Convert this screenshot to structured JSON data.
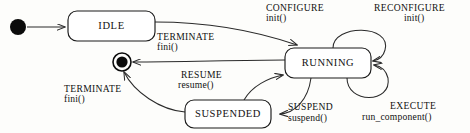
{
  "diagram": {
    "type": "uml-state-machine",
    "colors": {
      "background": "#fdfdfb",
      "stroke": "#1a1a1a",
      "node_fill": "#0b0b0b",
      "box_fill": "#ffffff",
      "text": "#111111"
    },
    "pseudostates": [
      {
        "id": "initial",
        "kind": "initial-state",
        "cx": 18,
        "cy": 27,
        "r": 8
      },
      {
        "id": "final",
        "kind": "final-state",
        "cx": 122,
        "cy": 62,
        "r_outer": 9,
        "r_inner": 5.6
      }
    ],
    "states": [
      {
        "id": "idle",
        "label": "IDLE",
        "x": 68,
        "y": 11,
        "w": 87,
        "h": 30
      },
      {
        "id": "running",
        "label": "RUNNING",
        "x": 285,
        "y": 48,
        "w": 86,
        "h": 30
      },
      {
        "id": "suspended",
        "label": "SUSPENDED",
        "x": 185,
        "y": 100,
        "w": 86,
        "h": 28
      }
    ],
    "transitions": [
      {
        "id": "start-to-idle",
        "from": "initial",
        "to": "idle",
        "event": "",
        "action": ""
      },
      {
        "id": "idle-to-running",
        "from": "idle",
        "to": "running",
        "event": "CONFIGURE",
        "action": "init()",
        "label_x": 266,
        "label_y": 11
      },
      {
        "id": "running-to-final",
        "from": "running",
        "to": "final",
        "event": "TERMINATE",
        "action": "fini()",
        "label_x": 157,
        "label_y": 40
      },
      {
        "id": "running-self-reconfigure",
        "from": "running",
        "to": "running",
        "event": "RECONFIGURE",
        "action": "init()",
        "label_x": 374,
        "label_y": 11
      },
      {
        "id": "running-self-execute",
        "from": "running",
        "to": "running",
        "event": "EXECUTE",
        "action": "run_component()",
        "label_x": 390,
        "label_y": 109
      },
      {
        "id": "running-to-suspended",
        "from": "running",
        "to": "suspended",
        "event": "SUSPEND",
        "action": "suspend()",
        "label_x": 288,
        "label_y": 110
      },
      {
        "id": "suspended-to-running",
        "from": "suspended",
        "to": "running",
        "event": "RESUME",
        "action": "resume()",
        "label_x": 181,
        "label_y": 78
      },
      {
        "id": "suspended-to-final",
        "from": "suspended",
        "to": "final",
        "event": "TERMINATE",
        "action": "fini()",
        "label_x": 64,
        "label_y": 92
      }
    ]
  }
}
